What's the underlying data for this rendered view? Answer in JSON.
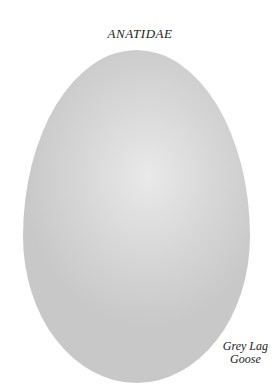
{
  "plate": {
    "family": "ANATIDAE",
    "species_line1": "Grey Lag",
    "species_line2": "Goose"
  },
  "colors": {
    "background": "#ffffff",
    "egg": "#d6d6d6"
  }
}
